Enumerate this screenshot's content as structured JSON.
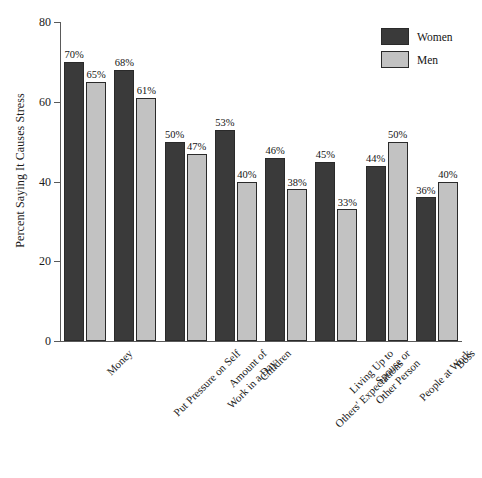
{
  "chart_data": {
    "type": "bar",
    "title": "",
    "xlabel": "",
    "ylabel": "Percent Saying It Causes Stress",
    "ylim": [
      0,
      80
    ],
    "yticks": [
      0,
      20,
      40,
      60,
      80
    ],
    "ytick_labels": [
      "0",
      "20",
      "40",
      "60",
      "80"
    ],
    "grid": false,
    "legend_position": "top-right",
    "categories": [
      "Money",
      "Put Pressure on Self",
      "Amount of Work in a Day",
      "Children",
      "Living Up to Others' Expectations",
      "Spouse or Other Person",
      "People at Work",
      "Boss"
    ],
    "category_lines": [
      [
        "Money"
      ],
      [
        "Put Pressure on Self"
      ],
      [
        "Amount of",
        "Work in a Day"
      ],
      [
        "Children"
      ],
      [
        "Living Up to",
        "Others' Expectations"
      ],
      [
        "Spouse or",
        "Other Person"
      ],
      [
        "People at Work"
      ],
      [
        "Boss"
      ]
    ],
    "series": [
      {
        "name": "Women",
        "color": "#3a3a3a",
        "values": [
          70,
          68,
          50,
          53,
          46,
          45,
          44,
          36
        ],
        "value_labels": [
          "70%",
          "68%",
          "50%",
          "53%",
          "46%",
          "45%",
          "44%",
          "36%"
        ]
      },
      {
        "name": "Men",
        "color": "#c2c2c2",
        "values": [
          65,
          61,
          47,
          40,
          38,
          33,
          50,
          40
        ],
        "value_labels": [
          "65%",
          "61%",
          "47%",
          "40%",
          "38%",
          "33%",
          "50%",
          "40%"
        ]
      }
    ]
  },
  "legend": {
    "items": [
      {
        "label": "Women",
        "color": "#3a3a3a"
      },
      {
        "label": "Men",
        "color": "#c2c2c2"
      }
    ]
  }
}
